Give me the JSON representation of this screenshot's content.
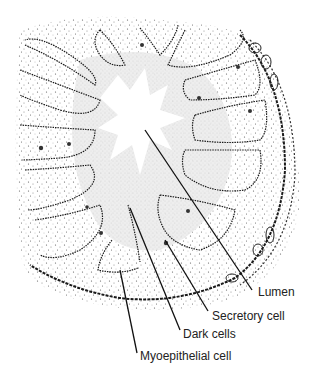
{
  "figure": {
    "type": "histology-illustration",
    "colors": {
      "ink": "#1a1a1a",
      "stipple": "#8a8a8a",
      "lumen_shade": "#d9d9d9",
      "background": "#ffffff"
    }
  },
  "labels": [
    {
      "id": "lumen",
      "text": "Lumen",
      "x": 258,
      "y": 285,
      "line": [
        145,
        130,
        252,
        290
      ]
    },
    {
      "id": "secretory-cell",
      "text": "Secretory cell",
      "x": 212,
      "y": 309,
      "line": [
        165,
        240,
        208,
        311
      ]
    },
    {
      "id": "dark-cells",
      "text": "Dark cells",
      "x": 183,
      "y": 327,
      "line": [
        130,
        208,
        180,
        330
      ]
    },
    {
      "id": "myoepithelial-cell",
      "text": "Myoepithelial cell",
      "x": 140,
      "y": 349,
      "line": [
        120,
        270,
        137,
        353
      ]
    }
  ]
}
